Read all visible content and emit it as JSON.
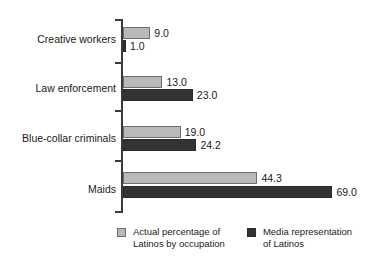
{
  "chart_data": {
    "type": "bar",
    "orientation": "horizontal",
    "title": "",
    "xlabel": "",
    "ylabel": "",
    "grid": false,
    "xlim": [
      0,
      75
    ],
    "categories": [
      "Creative workers",
      "Law enforcement",
      "Blue-collar criminals",
      "Maids"
    ],
    "series": [
      {
        "name": "Actual percentage of Latinos by occupation",
        "color": "#b9b9b9",
        "values": [
          9.0,
          13.0,
          19.0,
          44.3
        ],
        "labels": [
          "9.0",
          "13.0",
          "19.0",
          "44.3"
        ]
      },
      {
        "name": "Media representation of Latinos",
        "color": "#333333",
        "values": [
          1.0,
          23.0,
          24.2,
          69.0
        ],
        "labels": [
          "1.0",
          "23.0",
          "24.2",
          "69.0"
        ]
      }
    ],
    "legend_position": "bottom"
  },
  "legend": {
    "entries": [
      {
        "line1": "Actual percentage of",
        "line2": "Latinos by occupation",
        "swatch": "gray-swatch-icon"
      },
      {
        "line1": "Media representation",
        "line2": "of Latinos",
        "swatch": "dark-swatch-icon"
      }
    ]
  }
}
